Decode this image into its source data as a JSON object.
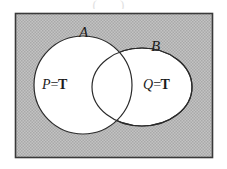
{
  "figure": {
    "type": "venn-diagram",
    "caption_remnant": "(   )",
    "universe": {
      "name": "universal-set-rectangle",
      "fill_color": "#b4b4b4",
      "fill_style": "stipple",
      "border_color": "#3a3a3a",
      "x": 15,
      "y": 13,
      "width": 197,
      "height": 144
    },
    "sets": [
      {
        "id": "A",
        "label": "A",
        "shape": "circle",
        "cx": 83,
        "cy": 85,
        "rx": 49,
        "ry": 49,
        "fill_color": "#ffffff",
        "stroke_color": "#2b2b2b",
        "label_x": 79,
        "label_y": 25,
        "proposition": {
          "variable": "P",
          "operator": "=",
          "value": "T",
          "text": "P=T"
        }
      },
      {
        "id": "B",
        "label": "B",
        "shape": "ellipse",
        "cx": 142,
        "cy": 87,
        "rx": 50,
        "ry": 39,
        "fill_color": "#ffffff",
        "stroke_color": "#2b2b2b",
        "label_x": 151,
        "label_y": 39,
        "proposition": {
          "variable": "Q",
          "operator": "=",
          "value": "T",
          "text": "Q=T"
        }
      }
    ],
    "intersection": {
      "name": "intersection-region",
      "fill_color": "#ffffff"
    }
  },
  "chart_data": {
    "type": "venn",
    "title": "",
    "sets": [
      "A",
      "B"
    ],
    "set_labels": [
      "A",
      "B"
    ],
    "region_labels": [
      {
        "region": "A only",
        "label": "P=T"
      },
      {
        "region": "B only",
        "label": "Q=T"
      },
      {
        "region": "A and B",
        "label": ""
      }
    ],
    "universe_shaded": true,
    "sets_shaded": false,
    "legend": "none",
    "grid": false
  }
}
